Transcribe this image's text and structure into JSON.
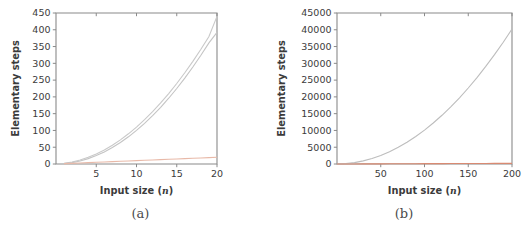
{
  "figure": {
    "panels": [
      {
        "id": "panel-a",
        "caption": "(a)",
        "chart": {
          "type": "line",
          "title": "",
          "xlabel_main": "Input size",
          "xlabel_paren_open": "(",
          "xlabel_var": "n",
          "xlabel_paren_close": ")",
          "ylabel": "Elementary steps",
          "xlim": [
            0,
            20
          ],
          "ylim": [
            0,
            450
          ],
          "xticks": [
            5,
            10,
            15,
            20
          ],
          "xticklabels": [
            "5",
            "10",
            "15",
            "20"
          ],
          "yticks": [
            0,
            50,
            100,
            150,
            200,
            250,
            300,
            350,
            400,
            450
          ],
          "yticklabels": [
            "0",
            "50",
            "100",
            "150",
            "200",
            "250",
            "300",
            "350",
            "400",
            "450"
          ],
          "grid": false,
          "legend": "none",
          "x": [
            1,
            2,
            3,
            4,
            5,
            6,
            7,
            8,
            9,
            10,
            11,
            12,
            13,
            14,
            15,
            16,
            17,
            18,
            19,
            20
          ],
          "series": [
            {
              "name": "upper-quadratic",
              "color": "#c9c9c9",
              "values": [
                2,
                6,
                12,
                20,
                30,
                42,
                56,
                72,
                90,
                110,
                132,
                156,
                182,
                210,
                240,
                272,
                306,
                342,
                380,
                440
              ]
            },
            {
              "name": "lower-quadratic",
              "color": "#c4c4c4",
              "values": [
                1,
                4,
                9,
                16,
                25,
                36,
                49,
                64,
                81,
                100,
                121,
                144,
                169,
                196,
                225,
                256,
                289,
                324,
                361,
                392
              ]
            },
            {
              "name": "linear-baseline",
              "color": "#e8b9a8",
              "values": [
                1,
                2,
                3,
                4,
                5,
                6,
                7,
                8,
                9,
                10,
                11,
                12,
                13,
                14,
                15,
                16,
                17,
                18,
                19,
                20
              ]
            }
          ]
        }
      },
      {
        "id": "panel-b",
        "caption": "(b)",
        "chart": {
          "type": "line",
          "title": "",
          "xlabel_main": "Input size",
          "xlabel_paren_open": "(",
          "xlabel_var": "n",
          "xlabel_paren_close": ")",
          "ylabel": "Elementary steps",
          "xlim": [
            0,
            200
          ],
          "ylim": [
            0,
            45000
          ],
          "xticks": [
            50,
            100,
            150,
            200
          ],
          "xticklabels": [
            "50",
            "100",
            "150",
            "200"
          ],
          "yticks": [
            0,
            5000,
            10000,
            15000,
            20000,
            25000,
            30000,
            35000,
            40000,
            45000
          ],
          "yticklabels": [
            "0",
            "5000",
            "10000",
            "15000",
            "20000",
            "25000",
            "30000",
            "35000",
            "40000",
            "45000"
          ],
          "grid": false,
          "legend": "none",
          "x": [
            0,
            10,
            20,
            30,
            40,
            50,
            60,
            70,
            80,
            90,
            100,
            110,
            120,
            130,
            140,
            150,
            160,
            170,
            180,
            190,
            200
          ],
          "series": [
            {
              "name": "quadratic",
              "color": "#bdbdbd",
              "values": [
                0,
                110,
                420,
                930,
                1640,
                2550,
                3660,
                4970,
                6480,
                8190,
                10100,
                12210,
                14520,
                17030,
                19740,
                22650,
                25760,
                29070,
                32580,
                36290,
                40200
              ]
            },
            {
              "name": "linear-baseline",
              "color": "#d98a72",
              "values": [
                0,
                10,
                20,
                30,
                40,
                50,
                60,
                70,
                80,
                90,
                100,
                110,
                120,
                130,
                140,
                150,
                160,
                170,
                180,
                190,
                200
              ]
            }
          ]
        }
      }
    ]
  },
  "chart_data": [
    {
      "type": "line",
      "title": "",
      "xlabel": "Input size (n)",
      "ylabel": "Elementary steps",
      "xlim": [
        0,
        20
      ],
      "ylim": [
        0,
        450
      ],
      "xticks": [
        5,
        10,
        15,
        20
      ],
      "yticks": [
        0,
        50,
        100,
        150,
        200,
        250,
        300,
        350,
        400,
        450
      ],
      "grid": false,
      "legend": "none",
      "x": [
        1,
        2,
        3,
        4,
        5,
        6,
        7,
        8,
        9,
        10,
        11,
        12,
        13,
        14,
        15,
        16,
        17,
        18,
        19,
        20
      ],
      "series": [
        {
          "name": "upper-quadratic",
          "values": [
            2,
            6,
            12,
            20,
            30,
            42,
            56,
            72,
            90,
            110,
            132,
            156,
            182,
            210,
            240,
            272,
            306,
            342,
            380,
            440
          ]
        },
        {
          "name": "lower-quadratic",
          "values": [
            1,
            4,
            9,
            16,
            25,
            36,
            49,
            64,
            81,
            100,
            121,
            144,
            169,
            196,
            225,
            256,
            289,
            324,
            361,
            392
          ]
        },
        {
          "name": "linear-baseline",
          "values": [
            1,
            2,
            3,
            4,
            5,
            6,
            7,
            8,
            9,
            10,
            11,
            12,
            13,
            14,
            15,
            16,
            17,
            18,
            19,
            20
          ]
        }
      ]
    },
    {
      "type": "line",
      "title": "",
      "xlabel": "Input size (n)",
      "ylabel": "Elementary steps",
      "xlim": [
        0,
        200
      ],
      "ylim": [
        0,
        45000
      ],
      "xticks": [
        50,
        100,
        150,
        200
      ],
      "yticks": [
        0,
        5000,
        10000,
        15000,
        20000,
        25000,
        30000,
        35000,
        40000,
        45000
      ],
      "grid": false,
      "legend": "none",
      "x": [
        0,
        10,
        20,
        30,
        40,
        50,
        60,
        70,
        80,
        90,
        100,
        110,
        120,
        130,
        140,
        150,
        160,
        170,
        180,
        190,
        200
      ],
      "series": [
        {
          "name": "quadratic",
          "values": [
            0,
            110,
            420,
            930,
            1640,
            2550,
            3660,
            4970,
            6480,
            8190,
            10100,
            12210,
            14520,
            17030,
            19740,
            22650,
            25760,
            29070,
            32580,
            36290,
            40200
          ]
        },
        {
          "name": "linear-baseline",
          "values": [
            0,
            10,
            20,
            30,
            40,
            50,
            60,
            70,
            80,
            90,
            100,
            110,
            120,
            130,
            140,
            150,
            160,
            170,
            180,
            190,
            200
          ]
        }
      ]
    }
  ]
}
